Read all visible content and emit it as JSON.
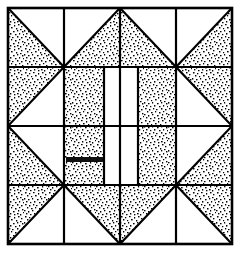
{
  "diagram": {
    "title": "Quilt Block Pattern",
    "type": "quilt-block-line-drawing",
    "style": "black line art with stippled (dotted) fill",
    "grid": {
      "rows": 4,
      "columns": 4
    },
    "colors": {
      "background": "#ffffff",
      "line": "#000000",
      "fill_light": "#ffffff",
      "fill_stipple": "#000000"
    },
    "frame": {
      "x": 8,
      "y": 8,
      "width": 224,
      "height": 236,
      "stroke_width": 2.4
    },
    "grid_lines": {
      "vertical_x": [
        8,
        64,
        120,
        176,
        232
      ],
      "horizontal_y": [
        8,
        67,
        126,
        185,
        244
      ]
    },
    "units": [
      {
        "row": 1,
        "col": 1,
        "name": "half-square-triangle",
        "stipple_corner": "bottom-left"
      },
      {
        "row": 1,
        "col": 2,
        "name": "half-square-triangle",
        "stipple_corner": "bottom-right"
      },
      {
        "row": 1,
        "col": 3,
        "name": "half-square-triangle",
        "stipple_corner": "bottom-left"
      },
      {
        "row": 1,
        "col": 4,
        "name": "half-square-triangle",
        "stipple_corner": "bottom-right"
      },
      {
        "row": 2,
        "col": 1,
        "name": "flying-geese-left-top",
        "stipple_corner": "top-left-wedge"
      },
      {
        "row": 2,
        "col": 2,
        "name": "solid-stipple-square",
        "stipple_corner": "full"
      },
      {
        "row": 2,
        "col": 3,
        "name": "white-strip-pair",
        "stipple_corner": "none"
      },
      {
        "row": 2,
        "col": 4,
        "name": "flying-geese-right-top",
        "stipple_corner": "top-right-wedge"
      },
      {
        "row": 3,
        "col": 1,
        "name": "flying-geese-left-bottom",
        "stipple_corner": "bottom-left-wedge"
      },
      {
        "row": 3,
        "col": 2,
        "name": "solid-stipple-square",
        "stipple_corner": "full"
      },
      {
        "row": 3,
        "col": 3,
        "name": "white-strip-pair",
        "stipple_corner": "none"
      },
      {
        "row": 3,
        "col": 4,
        "name": "flying-geese-right-bottom",
        "stipple_corner": "bottom-right-wedge"
      },
      {
        "row": 4,
        "col": 1,
        "name": "half-square-triangle",
        "stipple_corner": "top-left"
      },
      {
        "row": 4,
        "col": 2,
        "name": "half-square-triangle",
        "stipple_corner": "top-right"
      },
      {
        "row": 4,
        "col": 3,
        "name": "half-square-triangle",
        "stipple_corner": "top-left"
      },
      {
        "row": 4,
        "col": 4,
        "name": "half-square-triangle",
        "stipple_corner": "top-right"
      }
    ],
    "center_panel": {
      "left_stipple_x": 64,
      "left_stipple_w": 40,
      "white_strip_x": 104,
      "white_strip_w": 34,
      "right_stipple_x": 138,
      "right_stipple_w": 38,
      "top_y": 67,
      "bottom_y": 185,
      "divider_x": 121
    },
    "smudge_mark": {
      "present": true,
      "description": "dark horizontal ink smudge in lower-left center block",
      "x": 66,
      "y": 157,
      "width": 38,
      "height": 5
    }
  }
}
